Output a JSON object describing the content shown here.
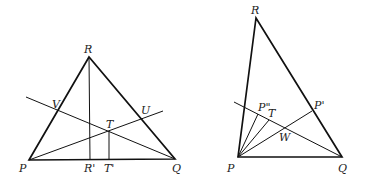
{
  "figures": [
    {
      "id": "left",
      "labels": {
        "R": "R",
        "P": "P",
        "Q": "Q",
        "V": "V",
        "U": "U",
        "T": "T",
        "R_prime": "R'",
        "T_prime": "T'"
      }
    },
    {
      "id": "right",
      "labels": {
        "R": "R",
        "P": "P",
        "Q": "Q",
        "P_prime": "P'",
        "P_double_prime": "P\"",
        "T": "T",
        "W": "W"
      }
    }
  ],
  "colors": {
    "stroke": "#111111",
    "background": "#ffffff"
  }
}
